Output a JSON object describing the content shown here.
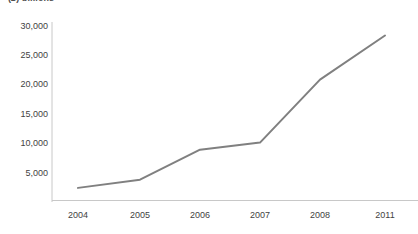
{
  "chart_data": {
    "type": "line",
    "title": "(£) billions",
    "xlabel": "",
    "ylabel": "",
    "categories": [
      "2004",
      "2005",
      "2006",
      "2007",
      "2008",
      "2011"
    ],
    "values": [
      2400,
      3800,
      8900,
      10100,
      20800,
      28300
    ],
    "series": [
      {
        "name": "value",
        "values": [
          2400,
          3800,
          8900,
          10100,
          20800,
          28300
        ]
      }
    ],
    "ylim": [
      0,
      30000
    ],
    "yticks": [
      5000,
      10000,
      15000,
      20000,
      25000,
      30000
    ],
    "ytick_labels": [
      "5,000",
      "10,000",
      "15,000",
      "20,000",
      "25,000",
      "30,000"
    ],
    "xtick_labels": [
      "2004",
      "2005",
      "2006",
      "2007",
      "2008",
      "2011"
    ],
    "grid": false,
    "legend": false,
    "legend_position": "none",
    "markers": false,
    "colors": {
      "line": "#808080",
      "axis": "#c8c8c8",
      "tick_text": "#3f3f3f",
      "caption_text": "#4d4d4d",
      "background": "#ffffff"
    }
  },
  "layout": {
    "plot_left": 52,
    "plot_right": 400,
    "zero_y": 202,
    "top_y": 22,
    "axis_bottom_y": 200,
    "axis_right_x": 418,
    "value_per_pixel": 170.0,
    "x_positions": [
      78,
      140,
      200,
      260,
      320,
      385
    ],
    "y_positions": [
      188,
      181,
      150,
      143,
      80,
      35
    ]
  }
}
